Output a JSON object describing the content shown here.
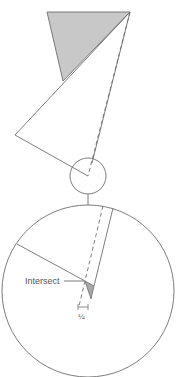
{
  "diagram": {
    "type": "geometric-construction",
    "colors": {
      "stroke": "#6e6e6e",
      "fill_shaded": "#c8c8c8",
      "background": "#ffffff",
      "text": "#555555"
    },
    "labels": {
      "intersect": "Intersect",
      "dimension": "¼"
    },
    "shapes": {
      "shaded_triangle": "top gray triangle",
      "open_triangle": "large white triangle",
      "small_circle": "detail circle",
      "large_circle": "magnified detail view",
      "small_shaded_triangle": "gray wedge at intersect"
    }
  }
}
